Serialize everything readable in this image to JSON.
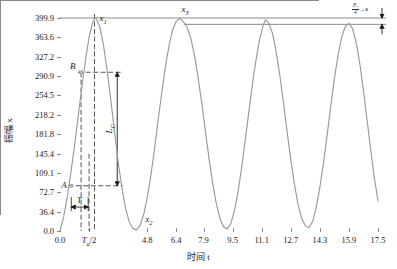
{
  "chart_data": {
    "type": "line",
    "title": "",
    "xlabel": "时间 t",
    "ylabel": "振幅 x",
    "xlim": [
      0.0,
      17.5
    ],
    "ylim": [
      0.0,
      399.9
    ],
    "grid": false,
    "legend": "none",
    "x_ticks": [
      "0.0",
      "Tₐ/2",
      "4.8",
      "6.4",
      "7.9",
      "9.5",
      "11.1",
      "12.7",
      "14.3",
      "15.9",
      "17.5"
    ],
    "x_tick_values": [
      0.0,
      1.6,
      4.8,
      6.4,
      7.9,
      9.5,
      11.1,
      12.7,
      14.3,
      15.9,
      17.5
    ],
    "y_ticks": [
      "0.0",
      "36.4",
      "72.7",
      "109.1",
      "145.4",
      "181.8",
      "218.2",
      "254.5",
      "290.9",
      "327.2",
      "363.6",
      "399.9"
    ],
    "y_tick_values": [
      0.0,
      36.4,
      72.7,
      109.1,
      145.4,
      181.8,
      218.2,
      254.5,
      290.9,
      327.2,
      363.6,
      399.9
    ],
    "series": [
      {
        "name": "oscillation",
        "color": "#9a9a9a",
        "x": [
          0.0,
          0.2,
          0.4,
          0.6,
          0.8,
          1.0,
          1.2,
          1.4,
          1.6,
          1.8,
          1.9,
          2.0,
          2.2,
          2.4,
          2.6,
          2.8,
          3.0,
          3.2,
          3.4,
          3.6,
          3.8,
          4.0,
          4.2,
          4.4,
          4.6,
          4.8,
          5.0,
          5.2,
          5.4,
          5.6,
          5.8,
          6.0,
          6.2,
          6.4,
          6.6,
          6.8,
          6.9,
          7.0,
          7.2,
          7.4,
          7.6,
          7.8,
          8.0,
          8.2,
          8.4,
          8.6,
          8.8,
          9.0,
          9.2,
          9.4,
          9.6,
          9.8,
          10.0,
          10.2,
          10.4,
          10.6,
          10.8,
          11.0,
          11.2,
          11.3,
          11.5,
          11.7,
          11.9,
          12.1,
          12.3,
          12.5,
          12.7,
          12.9,
          13.1,
          13.3,
          13.5,
          13.7,
          13.9,
          14.1,
          14.3,
          14.5,
          14.7,
          14.9,
          15.1,
          15.3,
          15.5,
          15.7,
          15.9,
          16.1,
          16.3,
          16.5,
          16.7,
          16.9,
          17.1,
          17.3,
          17.5
        ],
        "y": [
          0,
          26,
          64,
          110,
          160,
          215,
          270,
          320,
          364,
          392,
          399,
          398,
          382,
          348,
          300,
          245,
          186,
          130,
          82,
          44,
          18,
          5,
          2,
          10,
          30,
          62,
          104,
          154,
          208,
          260,
          308,
          348,
          378,
          394,
          399,
          392,
          388,
          382,
          362,
          330,
          288,
          240,
          188,
          136,
          90,
          52,
          24,
          8,
          4,
          14,
          38,
          74,
          120,
          172,
          226,
          278,
          324,
          362,
          388,
          396,
          390,
          370,
          336,
          292,
          240,
          186,
          134,
          88,
          50,
          24,
          10,
          6,
          18,
          44,
          82,
          128,
          180,
          234,
          286,
          330,
          364,
          384,
          390,
          380,
          354,
          314,
          264,
          208,
          152,
          100,
          56
        ],
        "peaks": [
          {
            "label": "x₁",
            "x": 1.9,
            "y": 399.9
          },
          {
            "label": "x₃",
            "x": 6.8,
            "y": 388.0
          }
        ],
        "troughs": [
          {
            "label": "x₂",
            "x": 4.2,
            "y": 8.0
          }
        ]
      }
    ],
    "annotations": [
      {
        "name": "point-A",
        "label": "A",
        "x": 0.62,
        "y": 85.0
      },
      {
        "name": "point-B",
        "label": "B",
        "x": 1.16,
        "y": 298.0
      },
      {
        "name": "interval-T",
        "label": "T",
        "x_start": 0.62,
        "x_end": 1.55,
        "y": 45.0
      },
      {
        "name": "amplitude-Lc",
        "label": "Lᴄ",
        "x": 3.15,
        "y_top": 298.0,
        "y_bottom": 85.0
      },
      {
        "name": "decay-delta",
        "fraction_num": "Fₐ",
        "fraction_den": "4",
        "tail": "→κ"
      }
    ],
    "reference_lines": [
      {
        "name": "upper-reference-line",
        "y": 399.9
      },
      {
        "name": "lower-reference-line",
        "y": 388.0
      }
    ]
  },
  "labels": {
    "x_axis_title": "时间 t",
    "y_axis_title": "振幅 x",
    "peak1": "x",
    "peak1_sub": "1",
    "peak3": "x",
    "peak3_sub": "3",
    "trough2": "x",
    "trough2_sub": "2",
    "point_a": "A",
    "point_b": "B",
    "period_t": "T",
    "lc": "L",
    "lc_sub": "C",
    "ta_half": "T",
    "ta_half_sub": "a",
    "ta_half_rest": "/2"
  },
  "x_tick_labels": [
    "0.0",
    "",
    "4.8",
    "6.4",
    "7.9",
    "9.5",
    "11.1",
    "12.7",
    "14.3",
    "15.9",
    "17.5"
  ],
  "y_tick_labels": [
    "0.0",
    "36.4",
    "72.7",
    "109.1",
    "145.4",
    "181.8",
    "218.2",
    "254.5",
    "290.9",
    "327.2",
    "363.6",
    "399.9"
  ],
  "colors": {
    "curve": "#9a9a9a",
    "axis": "#8a8a8a",
    "text": "#1a1a1a",
    "dashed": "#2a2a2a",
    "background": "#ffffff"
  }
}
